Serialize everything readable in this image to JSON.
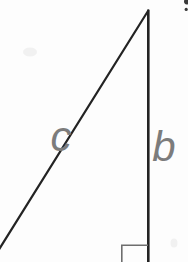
{
  "figure": {
    "type": "right-triangle-diagram",
    "labels": {
      "hypotenuse": "c",
      "vertical_leg": "b"
    },
    "colors": {
      "background": "#fdfdfd",
      "line": "#232323",
      "angle_marker": "#6e6e6e",
      "label_text": "#7c7c7c",
      "corner_mark": "#3a3a3a",
      "smudge": "#f1f1f1"
    }
  }
}
